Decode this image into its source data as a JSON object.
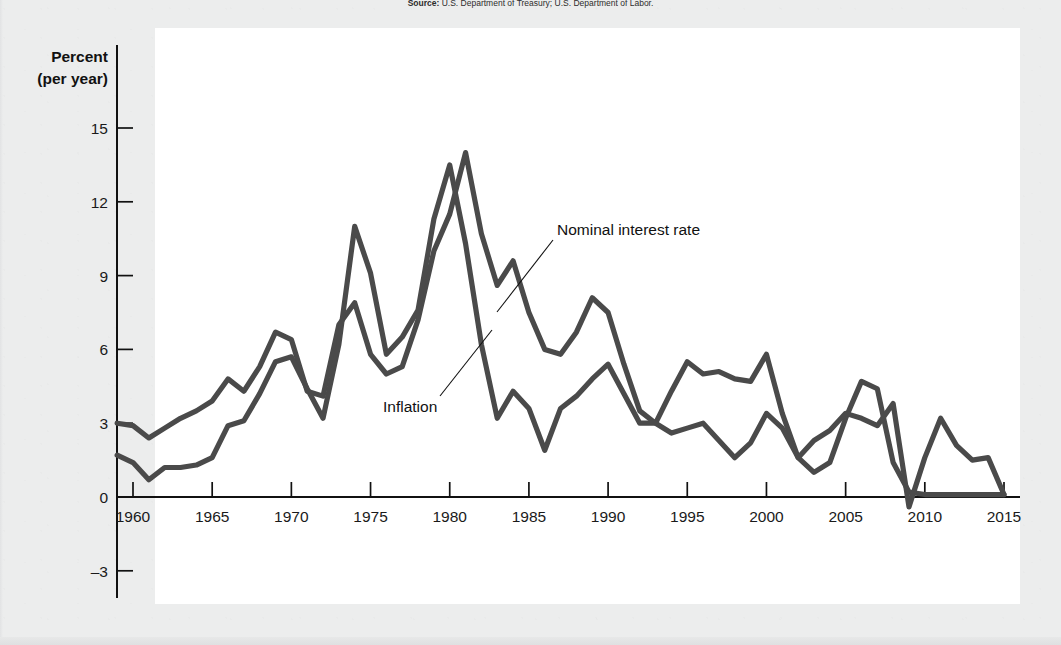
{
  "source_note": {
    "label": "Source:",
    "text": "U.S. Department of Treasury; U.S. Department of Labor."
  },
  "axis": {
    "y_title_line1": "Percent",
    "y_title_line2": "(per year)",
    "y_ticks": [
      "15",
      "12",
      "9",
      "6",
      "3",
      "0",
      "–3"
    ],
    "x_ticks": [
      "1960",
      "1965",
      "1970",
      "1975",
      "1980",
      "1985",
      "1990",
      "1995",
      "2000",
      "2005",
      "2010",
      "2015"
    ]
  },
  "labels": {
    "nominal": "Nominal interest rate",
    "inflation": "Inflation"
  },
  "colors": {
    "line": "#4a4a4a",
    "axis": "#111111",
    "panel": "#ffffff",
    "page": "#eceded"
  },
  "ghost_text": [
    {
      "x": 212,
      "y": 40,
      "t": "and the Fisher Effect"
    },
    {
      "x": 196,
      "y": 78,
      "t": "and the relationship between inflation and interest rates"
    },
    {
      "x": 196,
      "y": 110,
      "t": "that in every country nominal interest rates and inflation rates"
    },
    {
      "x": 196,
      "y": 142,
      "t": "move together, as the inflation rate has risen, so too, loosely speaking"
    },
    {
      "x": 196,
      "y": 174,
      "t": "the average, the Fisher effect describes a close connection with low rates"
    },
    {
      "x": 196,
      "y": 206,
      "t": "and periods of more moderate rate of inflation and interest rates."
    },
    {
      "x": 196,
      "y": 238,
      "t": "This figure shows that the nominal interest rate and the inflation"
    },
    {
      "x": 196,
      "y": 270,
      "t": "rate in the United States tend to move together over the interval"
    },
    {
      "x": 196,
      "y": 302,
      "t": "period of which to raise the inflation rate."
    },
    {
      "x": 196,
      "y": 352,
      "t": "The Relationship of Nominal Interest Rates and Inflation Rates"
    },
    {
      "x": 196,
      "y": 404,
      "t": "that the nominal interest rate reflects the inflation rate that the"
    },
    {
      "x": 196,
      "y": 436,
      "t": "real interest rate and the expected rate of inflation closely."
    },
    {
      "x": 196,
      "y": 500,
      "t": "and lose the rate of interest."
    },
    {
      "x": 196,
      "y": 556,
      "t": "Nominal interest rate = Real interest rate + Inflation rate"
    }
  ],
  "chart_data": {
    "type": "line",
    "title": "",
    "xlabel": "",
    "ylabel": "Percent (per year)",
    "xlim": [
      1959,
      2015
    ],
    "ylim": [
      -4,
      16
    ],
    "grid": false,
    "legend": "inline-annotations",
    "x": [
      1959,
      1960,
      1961,
      1962,
      1963,
      1964,
      1965,
      1966,
      1967,
      1968,
      1969,
      1970,
      1971,
      1972,
      1973,
      1974,
      1975,
      1976,
      1977,
      1978,
      1979,
      1980,
      1981,
      1982,
      1983,
      1984,
      1985,
      1986,
      1987,
      1988,
      1989,
      1990,
      1991,
      1992,
      1993,
      1994,
      1995,
      1996,
      1997,
      1998,
      1999,
      2000,
      2001,
      2002,
      2003,
      2004,
      2005,
      2006,
      2007,
      2008,
      2009,
      2010,
      2011,
      2012,
      2013,
      2014,
      2015
    ],
    "series": [
      {
        "name": "Nominal interest rate",
        "values": [
          3.0,
          2.9,
          2.4,
          2.8,
          3.2,
          3.5,
          3.9,
          4.8,
          4.3,
          5.3,
          6.7,
          6.4,
          4.3,
          4.1,
          7.0,
          7.9,
          5.8,
          5.0,
          5.3,
          7.2,
          10.0,
          11.5,
          14.0,
          10.7,
          8.6,
          9.6,
          7.5,
          6.0,
          5.8,
          6.7,
          8.1,
          7.5,
          5.4,
          3.5,
          3.0,
          4.3,
          5.5,
          5.0,
          5.1,
          4.8,
          4.7,
          5.8,
          3.4,
          1.6,
          1.0,
          1.4,
          3.2,
          4.7,
          4.4,
          1.4,
          0.2,
          0.1,
          0.1,
          0.1,
          0.1,
          0.1,
          0.1
        ]
      },
      {
        "name": "Inflation",
        "values": [
          1.7,
          1.4,
          0.7,
          1.2,
          1.2,
          1.3,
          1.6,
          2.9,
          3.1,
          4.2,
          5.5,
          5.7,
          4.4,
          3.2,
          6.2,
          11.0,
          9.1,
          5.8,
          6.5,
          7.6,
          11.3,
          13.5,
          10.3,
          6.2,
          3.2,
          4.3,
          3.6,
          1.9,
          3.6,
          4.1,
          4.8,
          5.4,
          4.2,
          3.0,
          3.0,
          2.6,
          2.8,
          3.0,
          2.3,
          1.6,
          2.2,
          3.4,
          2.8,
          1.6,
          2.3,
          2.7,
          3.4,
          3.2,
          2.9,
          3.8,
          -0.4,
          1.6,
          3.2,
          2.1,
          1.5,
          1.6,
          0.1
        ]
      }
    ]
  }
}
